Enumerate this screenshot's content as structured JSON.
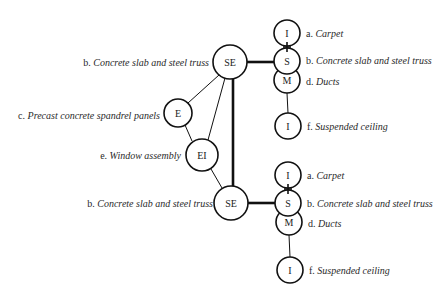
{
  "diagram": {
    "nodes": [
      {
        "id": "se_top",
        "label": "SE",
        "cx": 230,
        "cy": 62,
        "r": 17
      },
      {
        "id": "e",
        "label": "E",
        "cx": 178,
        "cy": 113,
        "r": 14
      },
      {
        "id": "ei",
        "label": "EI",
        "cx": 202,
        "cy": 155,
        "r": 16
      },
      {
        "id": "se_bottom",
        "label": "SE",
        "cx": 231,
        "cy": 203,
        "r": 17
      },
      {
        "id": "i1_top",
        "label": "I",
        "cx": 287,
        "cy": 33,
        "r": 13
      },
      {
        "id": "s_top",
        "label": "S",
        "cx": 287,
        "cy": 61,
        "r": 13
      },
      {
        "id": "m_top",
        "label": "M",
        "cx": 287,
        "cy": 80,
        "r": 13
      },
      {
        "id": "i2_top",
        "label": "I",
        "cx": 288,
        "cy": 126,
        "r": 13
      },
      {
        "id": "i1_bottom",
        "label": "I",
        "cx": 288,
        "cy": 175,
        "r": 13
      },
      {
        "id": "s_bottom",
        "label": "S",
        "cx": 288,
        "cy": 203,
        "r": 13
      },
      {
        "id": "m_bottom",
        "label": "M",
        "cx": 289,
        "cy": 222,
        "r": 13
      },
      {
        "id": "i2_bottom",
        "label": "I",
        "cx": 290,
        "cy": 270,
        "r": 13
      }
    ],
    "edges": [
      {
        "from": "se_top",
        "to": "e",
        "weight": "thin"
      },
      {
        "from": "se_top",
        "to": "ei",
        "weight": "thin"
      },
      {
        "from": "e",
        "to": "ei",
        "weight": "thin"
      },
      {
        "from": "ei",
        "to": "se_bottom",
        "weight": "thin"
      },
      {
        "from": "se_top",
        "to": "se_bottom",
        "weight": "thick"
      },
      {
        "from": "se_top",
        "to": "s_top",
        "weight": "thick"
      },
      {
        "from": "se_bottom",
        "to": "s_bottom",
        "weight": "thick"
      },
      {
        "from": "i1_top",
        "to": "s_top",
        "weight": "cross"
      },
      {
        "from": "m_top",
        "to": "i2_top",
        "weight": "thin"
      },
      {
        "from": "i1_bottom",
        "to": "s_bottom",
        "weight": "cross"
      },
      {
        "from": "m_bottom",
        "to": "i2_bottom",
        "weight": "thin"
      }
    ]
  },
  "labels": {
    "left": {
      "se_top": {
        "prefix": "b.",
        "text": "Concrete slab and steel truss"
      },
      "e": {
        "prefix": "c.",
        "text": "Precast concrete spandrel panels"
      },
      "ei": {
        "prefix": "e.",
        "text": "Window assembly"
      },
      "se_bottom": {
        "prefix": "b.",
        "text": "Concrete slab and steel truss"
      }
    },
    "right_top": {
      "i1": {
        "prefix": "a.",
        "text": "Carpet"
      },
      "s": {
        "prefix": "b.",
        "text": "Concrete slab and steel truss"
      },
      "m": {
        "prefix": "d.",
        "text": "Ducts"
      },
      "i2": {
        "prefix": "f.",
        "text": "Suspended ceiling"
      }
    },
    "right_bottom": {
      "i1": {
        "prefix": "a.",
        "text": "Carpet"
      },
      "s": {
        "prefix": "b.",
        "text": "Concrete slab and steel truss"
      },
      "m": {
        "prefix": "d.",
        "text": "Ducts"
      },
      "i2": {
        "prefix": "f.",
        "text": "Suspended ceiling"
      }
    }
  }
}
